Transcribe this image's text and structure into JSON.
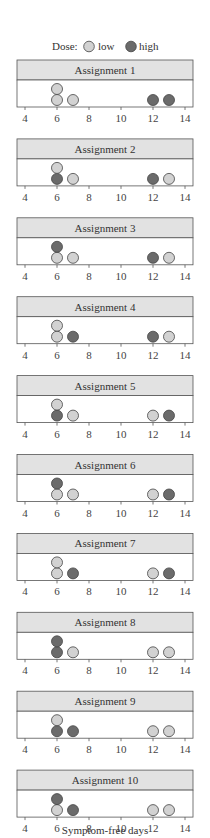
{
  "chart_data": {
    "type": "scatter",
    "subtype": "faceted dot plot",
    "legend": {
      "title": "Dose:",
      "entries": [
        {
          "label": "low",
          "color": "#d2d2d2"
        },
        {
          "label": "high",
          "color": "#6b6b6b"
        }
      ],
      "position": "top"
    },
    "xlabel": "Symptom-free days",
    "xlim": [
      4,
      14
    ],
    "xticks": [
      4,
      6,
      8,
      10,
      12,
      14
    ],
    "grid": false,
    "panels": [
      {
        "title": "Assignment 1",
        "points": [
          {
            "x": 6,
            "dose": "low",
            "stack": 0
          },
          {
            "x": 6,
            "dose": "low",
            "stack": 1
          },
          {
            "x": 7,
            "dose": "low",
            "stack": 0
          },
          {
            "x": 12,
            "dose": "high",
            "stack": 0
          },
          {
            "x": 13,
            "dose": "high",
            "stack": 0
          }
        ]
      },
      {
        "title": "Assignment 2",
        "points": [
          {
            "x": 6,
            "dose": "high",
            "stack": 0
          },
          {
            "x": 6,
            "dose": "low",
            "stack": 1
          },
          {
            "x": 7,
            "dose": "low",
            "stack": 0
          },
          {
            "x": 12,
            "dose": "high",
            "stack": 0
          },
          {
            "x": 13,
            "dose": "low",
            "stack": 0
          }
        ]
      },
      {
        "title": "Assignment 3",
        "points": [
          {
            "x": 6,
            "dose": "low",
            "stack": 0
          },
          {
            "x": 6,
            "dose": "high",
            "stack": 1
          },
          {
            "x": 7,
            "dose": "low",
            "stack": 0
          },
          {
            "x": 12,
            "dose": "high",
            "stack": 0
          },
          {
            "x": 13,
            "dose": "low",
            "stack": 0
          }
        ]
      },
      {
        "title": "Assignment 4",
        "points": [
          {
            "x": 6,
            "dose": "low",
            "stack": 0
          },
          {
            "x": 6,
            "dose": "low",
            "stack": 1
          },
          {
            "x": 7,
            "dose": "high",
            "stack": 0
          },
          {
            "x": 12,
            "dose": "high",
            "stack": 0
          },
          {
            "x": 13,
            "dose": "low",
            "stack": 0
          }
        ]
      },
      {
        "title": "Assignment 5",
        "points": [
          {
            "x": 6,
            "dose": "high",
            "stack": 0
          },
          {
            "x": 6,
            "dose": "low",
            "stack": 1
          },
          {
            "x": 7,
            "dose": "low",
            "stack": 0
          },
          {
            "x": 12,
            "dose": "low",
            "stack": 0
          },
          {
            "x": 13,
            "dose": "high",
            "stack": 0
          }
        ]
      },
      {
        "title": "Assignment 6",
        "points": [
          {
            "x": 6,
            "dose": "low",
            "stack": 0
          },
          {
            "x": 6,
            "dose": "high",
            "stack": 1
          },
          {
            "x": 7,
            "dose": "low",
            "stack": 0
          },
          {
            "x": 12,
            "dose": "low",
            "stack": 0
          },
          {
            "x": 13,
            "dose": "high",
            "stack": 0
          }
        ]
      },
      {
        "title": "Assignment 7",
        "points": [
          {
            "x": 6,
            "dose": "low",
            "stack": 0
          },
          {
            "x": 6,
            "dose": "low",
            "stack": 1
          },
          {
            "x": 7,
            "dose": "high",
            "stack": 0
          },
          {
            "x": 12,
            "dose": "low",
            "stack": 0
          },
          {
            "x": 13,
            "dose": "high",
            "stack": 0
          }
        ]
      },
      {
        "title": "Assignment 8",
        "points": [
          {
            "x": 6,
            "dose": "high",
            "stack": 0
          },
          {
            "x": 6,
            "dose": "high",
            "stack": 1
          },
          {
            "x": 7,
            "dose": "low",
            "stack": 0
          },
          {
            "x": 12,
            "dose": "low",
            "stack": 0
          },
          {
            "x": 13,
            "dose": "low",
            "stack": 0
          }
        ]
      },
      {
        "title": "Assignment 9",
        "points": [
          {
            "x": 6,
            "dose": "high",
            "stack": 0
          },
          {
            "x": 6,
            "dose": "low",
            "stack": 1
          },
          {
            "x": 7,
            "dose": "high",
            "stack": 0
          },
          {
            "x": 12,
            "dose": "low",
            "stack": 0
          },
          {
            "x": 13,
            "dose": "low",
            "stack": 0
          }
        ]
      },
      {
        "title": "Assignment 10",
        "points": [
          {
            "x": 6,
            "dose": "low",
            "stack": 0
          },
          {
            "x": 6,
            "dose": "high",
            "stack": 1
          },
          {
            "x": 7,
            "dose": "high",
            "stack": 0
          },
          {
            "x": 12,
            "dose": "low",
            "stack": 0
          },
          {
            "x": 13,
            "dose": "low",
            "stack": 0
          }
        ]
      }
    ]
  },
  "style": {
    "header_fill": "#e2e2e2",
    "frame_stroke": "#555555",
    "point_stroke": "#444444"
  }
}
